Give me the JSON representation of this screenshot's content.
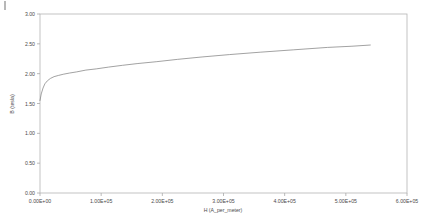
{
  "chart_data": {
    "type": "line",
    "title": "",
    "xlabel": "H (A_per_meter)",
    "ylabel": "B (tesla)",
    "xlim": [
      0,
      600000
    ],
    "ylim": [
      0,
      3.0
    ],
    "grid": false,
    "legend": null,
    "xticks": [
      0,
      100000,
      200000,
      300000,
      400000,
      500000,
      600000
    ],
    "xticklabels": [
      "0.00E+00",
      "1.00E+05",
      "2.00E+05",
      "3.00E+05",
      "4.00E+05",
      "5.00E+05",
      "6.00E+05"
    ],
    "yticks": [
      0.0,
      0.5,
      1.0,
      1.5,
      2.0,
      2.5,
      3.0
    ],
    "yticklabels": [
      "0.00",
      "0.50",
      "1.00",
      "1.50",
      "2.00",
      "2.50",
      "3.00"
    ],
    "series": [
      {
        "name": "B-H curve",
        "color": "#7a7a7a",
        "x": [
          0,
          2000,
          5000,
          8000,
          12000,
          17000,
          23000,
          30000,
          38000,
          48000,
          60000,
          75000,
          92000,
          112000,
          135000,
          160000,
          190000,
          225000,
          265000,
          310000,
          360000,
          415000,
          470000,
          510000,
          540000
        ],
        "y": [
          1.55,
          1.66,
          1.76,
          1.83,
          1.88,
          1.92,
          1.95,
          1.97,
          1.99,
          2.01,
          2.03,
          2.06,
          2.08,
          2.11,
          2.14,
          2.17,
          2.2,
          2.24,
          2.28,
          2.32,
          2.36,
          2.4,
          2.44,
          2.46,
          2.48
        ]
      }
    ]
  },
  "plot_box": {
    "left": 40,
    "top": 14,
    "right": 407,
    "bottom": 193
  },
  "corner_artifact": "tick-mark"
}
